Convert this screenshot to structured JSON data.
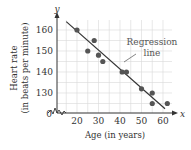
{
  "chart_data": {
    "type": "scatter",
    "title": "",
    "xlabel": "Age (in years)",
    "ylabel": "Heart rate (in beats per minute)",
    "ylabel_lines": [
      "Heart rate",
      "(in beats per minute)"
    ],
    "x_axis_letter": "x",
    "y_axis_letter": "y",
    "origin_label": "0",
    "xlim": [
      10.7,
      65
    ],
    "ylim": [
      120.5,
      164
    ],
    "x_ticks": [
      20,
      30,
      40,
      50,
      60
    ],
    "y_ticks": [
      130,
      140,
      150,
      160
    ],
    "grid": true,
    "axis_breaks": true,
    "series": [
      {
        "name": "Data points",
        "points": [
          {
            "x": 20,
            "y": 160
          },
          {
            "x": 25,
            "y": 150
          },
          {
            "x": 28,
            "y": 155
          },
          {
            "x": 30,
            "y": 148
          },
          {
            "x": 32,
            "y": 145
          },
          {
            "x": 41,
            "y": 140
          },
          {
            "x": 43,
            "y": 140
          },
          {
            "x": 50,
            "y": 132
          },
          {
            "x": 55,
            "y": 130
          },
          {
            "x": 55,
            "y": 125
          },
          {
            "x": 62,
            "y": 125
          }
        ]
      }
    ],
    "regression_line": {
      "x1": 15,
      "y1": 164,
      "x2": 60,
      "y2": 122.5
    },
    "annotations": [
      {
        "text_lines": [
          "Regression",
          "line"
        ],
        "points_to": {
          "x": 41,
          "y": 141
        }
      }
    ],
    "colors": {
      "points": "#555555",
      "line": "#333333",
      "grid": "#d9d9d9",
      "text": "#333333"
    }
  }
}
